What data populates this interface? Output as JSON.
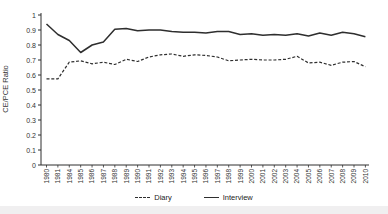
{
  "chart_data": {
    "type": "line",
    "title": "",
    "ylabel": "CE/PCE Ratio",
    "xlabel": "",
    "ylim": [
      0,
      1
    ],
    "yticks": [
      0,
      0.1,
      0.2,
      0.3,
      0.4,
      0.5,
      0.6,
      0.7,
      0.8,
      0.9,
      1
    ],
    "ytick_labels": [
      "0",
      "0.1",
      "0.2",
      "0.3",
      "0.4",
      "0.5",
      "0.6",
      "0.7",
      "0.8",
      "0.9",
      "1"
    ],
    "categories": [
      "1980",
      "1981",
      "1984",
      "1985",
      "1986",
      "1987",
      "1988",
      "1989",
      "1990",
      "1991",
      "1992",
      "1993",
      "1994",
      "1995",
      "1996",
      "1997",
      "1998",
      "1999",
      "2000",
      "2001",
      "2002",
      "2003",
      "2004",
      "2005",
      "2006",
      "2007",
      "2008",
      "2009",
      "2010"
    ],
    "series": [
      {
        "name": "Diary",
        "line_style": "dashed",
        "values": [
          0.575,
          0.575,
          0.685,
          0.695,
          0.675,
          0.685,
          0.67,
          0.705,
          0.69,
          0.72,
          0.735,
          0.74,
          0.725,
          0.735,
          0.73,
          0.72,
          0.695,
          0.7,
          0.705,
          0.7,
          0.7,
          0.705,
          0.725,
          0.68,
          0.685,
          0.665,
          0.685,
          0.69,
          0.655
        ]
      },
      {
        "name": "Interview",
        "line_style": "solid",
        "values": [
          0.94,
          0.87,
          0.83,
          0.75,
          0.8,
          0.82,
          0.905,
          0.91,
          0.895,
          0.9,
          0.9,
          0.89,
          0.885,
          0.885,
          0.88,
          0.89,
          0.89,
          0.87,
          0.875,
          0.865,
          0.87,
          0.865,
          0.875,
          0.86,
          0.88,
          0.865,
          0.885,
          0.875,
          0.855
        ]
      }
    ],
    "legend_position": "bottom-center",
    "grid": false
  },
  "colors": {
    "line": "#2e2e2e",
    "text": "#333333",
    "background": "#ffffff",
    "bottom_strip": "#f0eff0"
  }
}
